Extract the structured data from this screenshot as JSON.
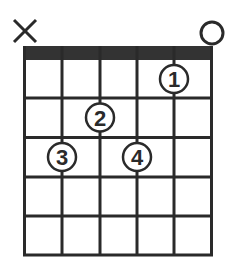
{
  "diagram": {
    "type": "guitar-chord-chart",
    "strings": 6,
    "frets_shown": 5,
    "colors": {
      "ink": "#2a2a2a",
      "nut": "#333333",
      "background": "#ffffff"
    },
    "open_muted": [
      {
        "string": 1,
        "marker": "muted",
        "symbol": "X"
      },
      {
        "string": 6,
        "marker": "open",
        "symbol": "O"
      }
    ],
    "fingers": [
      {
        "label": "1",
        "string": 5,
        "fret": 1
      },
      {
        "label": "2",
        "string": 3,
        "fret": 2
      },
      {
        "label": "3",
        "string": 2,
        "fret": 3
      },
      {
        "label": "4",
        "string": 4,
        "fret": 3
      }
    ]
  }
}
